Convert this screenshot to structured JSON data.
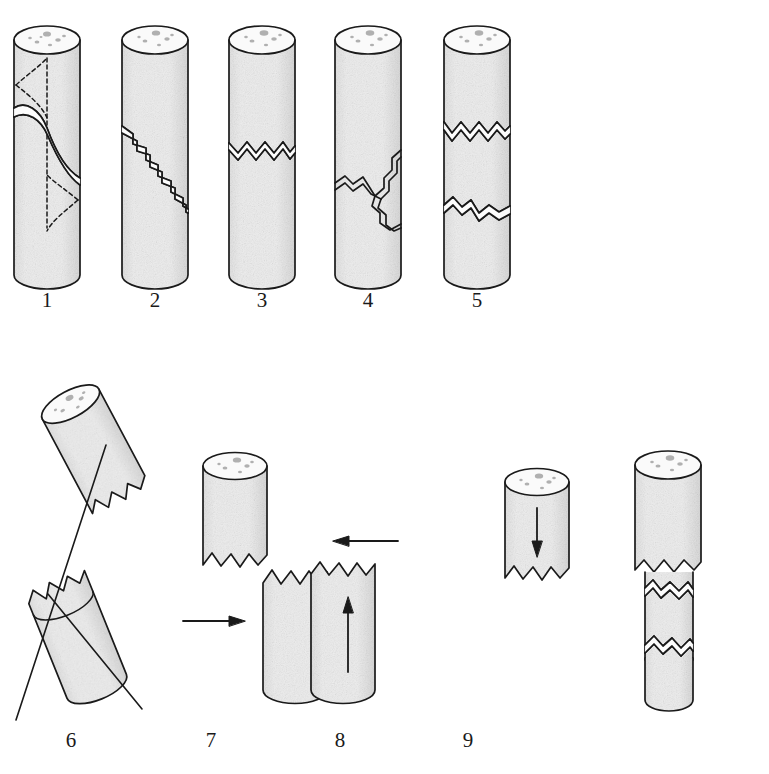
{
  "figure": {
    "background_color": "#ffffff",
    "width": 769,
    "height": 774,
    "ink_color": "#1a1a1a",
    "body_fill": "#ebebeb",
    "top_face_fill": "#f7f7f7",
    "aggregate_color": "#b3b3b3"
  },
  "rows": [
    {
      "name": "top-row",
      "label": "Specimens 1 to 5"
    },
    {
      "name": "bottom-row",
      "label": "Specimens 6 to 9"
    }
  ],
  "specimens": [
    {
      "id": 1,
      "label": "1",
      "label_x": 47,
      "label_y": 300,
      "pattern": "helical-shear-crack-with-dashed-construction-lines",
      "description": "Intact cylinder with a single S-shaped helical crack spiralling around the body, shown together with dashed construction lines marking the vertical axis and the hourglass envelope of the spiral.",
      "crack_style": "solid double line",
      "has_dashed_guides": true,
      "pieces": 1
    },
    {
      "id": 2,
      "label": "2",
      "label_x": 155,
      "label_y": 300,
      "pattern": "diagonal-stair-step-crack",
      "description": "Intact cylinder with a descending staircase (stepped diagonal) crack running from upper-left to lower-right.",
      "crack_style": "solid double line",
      "has_dashed_guides": false,
      "pieces": 1
    },
    {
      "id": 3,
      "label": "3",
      "label_x": 262,
      "label_y": 300,
      "pattern": "single-horizontal-zigzag-crack",
      "description": "Intact cylinder with one horizontal zigzag crack in the upper third.",
      "crack_style": "solid double line",
      "has_dashed_guides": false,
      "pieces": 1
    },
    {
      "id": 4,
      "label": "4",
      "label_x": 368,
      "label_y": 300,
      "pattern": "branching-y-shaped-crack",
      "description": "Intact cylinder with a branching Y-shaped crack: a crack from the right side meets a crack from the left side at a junction and continues down to the right edge.",
      "crack_style": "solid double line",
      "has_dashed_guides": false,
      "pieces": 1
    },
    {
      "id": 5,
      "label": "5",
      "label_x": 477,
      "label_y": 300,
      "pattern": "two-horizontal-zigzag-cracks",
      "description": "Intact cylinder with two parallel horizontal zigzag cracks, one near the top and one near the bottom, isolating a central band.",
      "crack_style": "solid double line",
      "has_dashed_guides": false,
      "pieces": 1
    },
    {
      "id": 6,
      "label": "6",
      "label_x": 71,
      "label_y": 740,
      "pattern": "separated-tilted-shear-halves",
      "description": "Two broken halves shown tilted and pulled apart along an inclined shear plane, with straight reference lines drawn through both pieces indicating the shear direction.",
      "crack_style": "sawtooth broken edges",
      "has_reference_lines": true,
      "pieces": 2
    },
    {
      "id": 7,
      "label": "7",
      "label_x": 211,
      "label_y": 740,
      "pattern": "laterally-offset-halves",
      "description": "Upper and lower broken pieces offset sideways from one another; a left-pointing arrow at the right of the upper piece and a right-pointing arrow at the left of the lower piece show the opposing lateral movement.",
      "crack_style": "sawtooth broken edges",
      "arrows": [
        {
          "name": "upper-left-arrow",
          "direction": "left"
        },
        {
          "name": "lower-right-arrow",
          "direction": "right"
        }
      ],
      "pieces": 2
    },
    {
      "id": 8,
      "label": "8",
      "label_x": 340,
      "label_y": 740,
      "pattern": "axially-separated-halves",
      "description": "Upper and lower broken pieces drawn apart along the axis; a downward arrow inside the upper piece and an upward arrow inside the lower piece indicate they are pressed together axially.",
      "crack_style": "sawtooth broken edges",
      "arrows": [
        {
          "name": "upper-down-arrow",
          "direction": "down"
        },
        {
          "name": "lower-up-arrow",
          "direction": "up"
        }
      ],
      "pieces": 2
    },
    {
      "id": 9,
      "label": "9",
      "label_x": 468,
      "label_y": 740,
      "pattern": "crushed-narrowed-mid-section",
      "description": "Cylinder with a crushed middle: the central band is narrower than the top and bottom, bounded above and below by jagged cracks, showing loss of material by crushing.",
      "crack_style": "sawtooth broken edges",
      "pieces": 3
    }
  ]
}
